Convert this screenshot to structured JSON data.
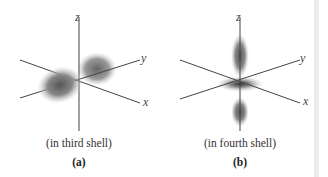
{
  "panels": [
    {
      "id": "a",
      "axes": {
        "x": "x",
        "y": "y",
        "z": "z"
      },
      "caption": "(in third shell)",
      "label": "(a)",
      "orbital": "two-lobe orbital along y axis"
    },
    {
      "id": "b",
      "axes": {
        "x": "x",
        "y": "y",
        "z": "z"
      },
      "caption": "(in fourth shell)",
      "label": "(b)",
      "orbital": "two-lobe orbital along z axis with torus-like ring in xy plane"
    }
  ]
}
